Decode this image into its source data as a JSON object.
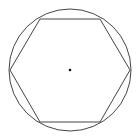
{
  "diagram": {
    "stroke_color": "#444444",
    "center_dot_color": "#111111",
    "background": "#ffffff",
    "circle": {
      "cx": 70,
      "cy": 70,
      "r": 61
    },
    "center": {
      "x": 70,
      "y": 70,
      "r": 1.3
    },
    "hexagon": {
      "points": "130,70 100,122 40,122 10,70 40,19 100,19"
    }
  }
}
